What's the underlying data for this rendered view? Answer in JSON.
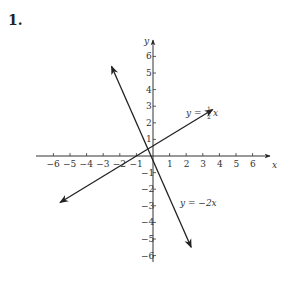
{
  "problem": {
    "number": "1."
  },
  "chart_data": {
    "type": "line",
    "title": "",
    "xlabel": "x",
    "ylabel": "y",
    "xlim": [
      -6.8,
      7
    ],
    "ylim": [
      -7,
      7
    ],
    "grid": false,
    "x_ticks": [
      -6,
      -5,
      -4,
      -3,
      -2,
      -1,
      1,
      2,
      3,
      4,
      5,
      6
    ],
    "y_ticks": [
      -6,
      -5,
      -4,
      -3,
      -2,
      -1,
      1,
      2,
      3,
      4,
      5,
      6
    ],
    "x_tick_labels": [
      "−6",
      "−5",
      "−4",
      "−3",
      "−2",
      "−1",
      "1",
      "2",
      "3",
      "4",
      "5",
      "6"
    ],
    "y_tick_labels": [
      "−6",
      "−5",
      "−4",
      "−3",
      "−2",
      "−1",
      "1",
      "2",
      "3",
      "4",
      "5",
      "6"
    ],
    "series": [
      {
        "name": "y = ½x",
        "equation": "y = 1/2 x",
        "slope": 0.5,
        "x": [
          -5.6,
          3.6
        ],
        "y": [
          -2.8,
          2.8
        ],
        "arrows": "both"
      },
      {
        "name": "y = −2x",
        "equation": "y = -2x",
        "slope": -2,
        "x": [
          -2.5,
          2.3
        ],
        "y": [
          5.4,
          -5.5
        ],
        "arrows": "both"
      }
    ],
    "annotations": [
      {
        "text": "y = ½x",
        "near_series": 0
      },
      {
        "text": "y = −2x",
        "near_series": 1
      }
    ]
  },
  "labels": {
    "x_axis": "x",
    "y_axis": "y",
    "eq1_prefix": "y = ",
    "eq1_num": "1",
    "eq1_den": "2",
    "eq1_var": "x",
    "eq2": "y = −2x"
  }
}
